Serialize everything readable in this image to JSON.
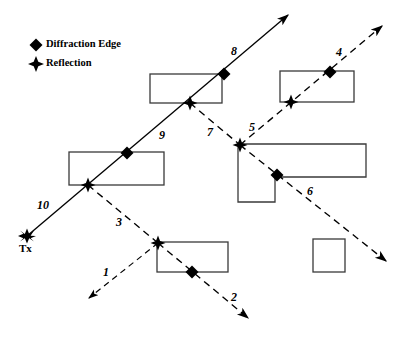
{
  "figure": {
    "title": "",
    "background_color": "#ffffff",
    "stroke_color": "#000000",
    "width": 409,
    "height": 342
  },
  "legend": {
    "items": [
      {
        "marker": "diamond-marker",
        "label": "Diffraction Edge",
        "x": 36,
        "y": 44
      },
      {
        "marker": "star-marker",
        "label": "Reflection",
        "x": 36,
        "y": 62
      }
    ]
  },
  "transmitter": {
    "name": "Tx",
    "label": "Tx",
    "x": 27,
    "y": 236,
    "marker": "star-marker"
  },
  "buildings": [
    {
      "name": "building-upper-left",
      "shape": "rect",
      "x": 150,
      "y": 74,
      "w": 72,
      "h": 29
    },
    {
      "name": "building-upper-right",
      "shape": "rect",
      "x": 280,
      "y": 71,
      "w": 74,
      "h": 31
    },
    {
      "name": "building-mid-left",
      "shape": "rect",
      "x": 69,
      "y": 152,
      "w": 95,
      "h": 33
    },
    {
      "name": "building-lower-mid",
      "shape": "rect",
      "x": 157,
      "y": 242,
      "w": 71,
      "h": 30
    },
    {
      "name": "building-lower-right",
      "shape": "rect",
      "x": 313,
      "y": 239,
      "w": 32,
      "h": 33
    },
    {
      "name": "building-l-shaped",
      "shape": "polygon",
      "points": "238,144 366,144 366,177 275,177 275,202 238,202"
    }
  ],
  "rays": [
    {
      "name": "ray-1",
      "label": "1",
      "style": "dashed",
      "label_x": 103,
      "label_y": 272
    },
    {
      "name": "ray-2",
      "label": "2",
      "style": "dashed",
      "label_x": 233,
      "label_y": 296
    },
    {
      "name": "ray-3",
      "label": "3",
      "style": "dashed",
      "label_x": 117,
      "label_y": 222
    },
    {
      "name": "ray-4",
      "label": "4",
      "style": "dashed",
      "label_x": 338,
      "label_y": 52
    },
    {
      "name": "ray-5",
      "label": "5",
      "style": "dashed",
      "label_x": 251,
      "label_y": 127
    },
    {
      "name": "ray-6",
      "label": "6",
      "style": "dashed",
      "label_x": 308,
      "label_y": 191
    },
    {
      "name": "ray-7",
      "label": "7",
      "style": "dashed",
      "label_x": 209,
      "label_y": 132
    },
    {
      "name": "ray-8",
      "label": "8",
      "style": "solid",
      "label_x": 232,
      "label_y": 53
    },
    {
      "name": "ray-9",
      "label": "9",
      "style": "solid",
      "label_x": 160,
      "label_y": 135
    },
    {
      "name": "ray-10",
      "label": "10",
      "style": "solid",
      "label_x": 40,
      "label_y": 206
    }
  ],
  "markers": {
    "diffraction_edges": [
      {
        "name": "diffraction-edge-a",
        "x": 224,
        "y": 74
      },
      {
        "name": "diffraction-edge-b",
        "x": 127,
        "y": 153
      },
      {
        "name": "diffraction-edge-c",
        "x": 330,
        "y": 72
      },
      {
        "name": "diffraction-edge-d",
        "x": 277,
        "y": 175
      },
      {
        "name": "diffraction-edge-e",
        "x": 192,
        "y": 272
      }
    ],
    "reflections": [
      {
        "name": "reflection-a",
        "x": 190,
        "y": 103
      },
      {
        "name": "reflection-b",
        "x": 88,
        "y": 185
      },
      {
        "name": "reflection-c",
        "x": 291,
        "y": 102
      },
      {
        "name": "reflection-d",
        "x": 240,
        "y": 145
      },
      {
        "name": "reflection-e",
        "x": 158,
        "y": 243
      }
    ]
  },
  "paths": {
    "main_solid": "27,236 290,13",
    "ray3_branch": "88,185 158,243",
    "ray1_branch": "158,243 87,300",
    "ray2_branch": "158,243 250,320",
    "ray7_branch": "190,103 240,145",
    "ray5_branch": "240,145 384,24",
    "ray6_branch": "240,145 388,263"
  }
}
